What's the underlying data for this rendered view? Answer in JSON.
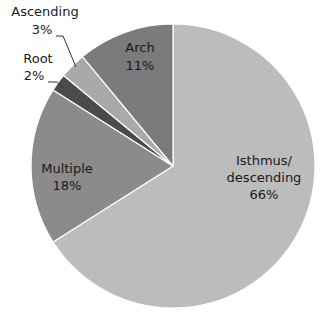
{
  "chart_data": {
    "type": "pie",
    "title": "",
    "start_angle_deg": 0,
    "direction": "clockwise",
    "slices": [
      {
        "label": "Isthmus/ descending",
        "label_lines": [
          "Isthmus/",
          "descending",
          "66%"
        ],
        "value": 66,
        "color": "#bcbcbc"
      },
      {
        "label": "Multiple",
        "label_lines": [
          "Multiple",
          "18%"
        ],
        "value": 18,
        "color": "#8b8b8b"
      },
      {
        "label": "Root",
        "label_lines": [
          "Root",
          "2%"
        ],
        "value": 2,
        "color": "#4b4b4b"
      },
      {
        "label": "Ascending",
        "label_lines": [
          "Ascending",
          "3%"
        ],
        "value": 3,
        "color": "#a9a9a9"
      },
      {
        "label": "Arch",
        "label_lines": [
          "Arch",
          "11%"
        ],
        "value": 11,
        "color": "#7b7b7b"
      }
    ],
    "categories": [
      "Isthmus/descending",
      "Multiple",
      "Root",
      "Ascending",
      "Arch"
    ],
    "values": [
      66,
      18,
      2,
      3,
      11
    ],
    "legend": "none",
    "data_labels": "inside/outside with leader lines"
  }
}
